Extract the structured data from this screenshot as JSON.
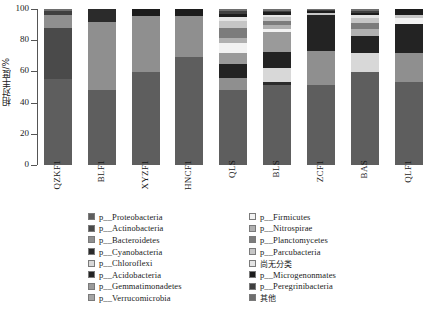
{
  "chart_data": {
    "type": "bar",
    "subtype": "stacked-percentage",
    "title": "",
    "xlabel": "",
    "ylabel": "相对丰度/%",
    "ylim": [
      0,
      100
    ],
    "yticks": [
      "0",
      "20",
      "40",
      "60",
      "80",
      "100"
    ],
    "grid": false,
    "legend_position": "bottom",
    "categories": [
      "QZKF1",
      "BLF1",
      "XYZF1",
      "HNCF1",
      "QLS",
      "BLS",
      "ZCF1",
      "BAS",
      "QLF1"
    ],
    "series": [
      {
        "name": "p__Proteobacteria",
        "color": "#5e5e5e",
        "values": [
          55.0,
          48.0,
          59.5,
          69.5,
          48.0,
          51.5,
          51.0,
          59.5,
          53.5
        ]
      },
      {
        "name": "p__Actinobacteria",
        "color": "#4a4a4a",
        "values": [
          33.0,
          0.0,
          0.0,
          0.0,
          0.0,
          0.0,
          0.0,
          0.0,
          0.0
        ]
      },
      {
        "name": "p__Bacteroidetes",
        "color": "#8f8f8f",
        "values": [
          8.0,
          44.0,
          36.0,
          26.0,
          7.5,
          0.0,
          22.0,
          0.0,
          18.0
        ]
      },
      {
        "name": "p__Cyanobacteria",
        "color": "#2b2b2b",
        "values": [
          0.0,
          8.0,
          0.0,
          0.0,
          0.0,
          1.5,
          0.0,
          0.0,
          0.0
        ]
      },
      {
        "name": "p__Chloroflexi",
        "color": "#d8d8d8",
        "values": [
          0.0,
          0.0,
          0.0,
          0.0,
          0.0,
          9.0,
          0.0,
          12.0,
          0.0
        ]
      },
      {
        "name": "p__Acidobacteria",
        "color": "#232323",
        "values": [
          0.0,
          0.0,
          0.0,
          0.0,
          9.0,
          10.5,
          23.0,
          11.0,
          19.0
        ]
      },
      {
        "name": "p__Gemmatimonadetes",
        "color": "#9a9a9a",
        "values": [
          0.0,
          0.0,
          0.0,
          0.0,
          7.5,
          13.0,
          0.0,
          0.0,
          0.0
        ]
      },
      {
        "name": "p__Verrucomicrobia",
        "color": "#a5a5a5",
        "values": [
          0.0,
          0.0,
          0.0,
          0.0,
          0.0,
          0.0,
          0.0,
          0.0,
          0.0
        ]
      },
      {
        "name": "p__Firmicutes",
        "color": "#f2f2f2",
        "values": [
          0.0,
          0.0,
          0.0,
          0.0,
          6.0,
          2.0,
          0.0,
          0.0,
          4.0
        ]
      },
      {
        "name": "p__Nitrospirae",
        "color": "#b0b0b0",
        "values": [
          0.0,
          0.0,
          0.0,
          0.0,
          3.5,
          2.0,
          0.0,
          4.5,
          0.0
        ]
      },
      {
        "name": "p__Planctomycetes",
        "color": "#7c7c7c",
        "values": [
          0.0,
          0.0,
          0.0,
          0.0,
          6.5,
          3.0,
          0.0,
          4.0,
          0.0
        ]
      },
      {
        "name": "p__Parcubacteria",
        "color": "#c6c6c6",
        "values": [
          0.0,
          0.0,
          0.0,
          0.0,
          4.5,
          2.5,
          1.5,
          3.0,
          2.0
        ]
      },
      {
        "name": "尚无分类",
        "color": "#e4e4e4",
        "values": [
          0.0,
          0.0,
          0.0,
          0.0,
          2.5,
          1.5,
          0.0,
          2.0,
          0.0
        ]
      },
      {
        "name": "p__Microgenonmates",
        "color": "#1c1c1c",
        "values": [
          0.0,
          0.0,
          4.5,
          4.5,
          2.0,
          1.5,
          1.0,
          1.5,
          3.5
        ]
      },
      {
        "name": "p__Peregrinibacteria",
        "color": "#3f3f3f",
        "values": [
          3.0,
          0.0,
          0.0,
          0.0,
          1.5,
          1.0,
          1.0,
          1.5,
          0.0
        ]
      },
      {
        "name": "其他",
        "color": "#6e6e6e",
        "values": [
          1.0,
          0.0,
          0.0,
          0.0,
          1.5,
          1.0,
          0.5,
          1.0,
          0.0
        ]
      }
    ]
  },
  "axis": {
    "y_title": "相对丰度/%",
    "y_ticks": [
      "100",
      "80",
      "60",
      "40",
      "20",
      "0"
    ]
  },
  "legend": {
    "left_column": [
      {
        "label": "p__Proteobacteria",
        "color": "#5e5e5e"
      },
      {
        "label": "p__Actinobacteria",
        "color": "#4a4a4a"
      },
      {
        "label": "p__Bacteroidetes",
        "color": "#8f8f8f"
      },
      {
        "label": "p__Cyanobacteria",
        "color": "#2b2b2b"
      },
      {
        "label": "p__Chloroflexi",
        "color": "#d8d8d8"
      },
      {
        "label": "p__Acidobacteria",
        "color": "#232323"
      },
      {
        "label": "p__Gemmatimonadetes",
        "color": "#9a9a9a"
      },
      {
        "label": "p__Verrucomicrobia",
        "color": "#a5a5a5"
      }
    ],
    "right_column": [
      {
        "label": "p__Firmicutes",
        "color": "#f2f2f2"
      },
      {
        "label": "p__Nitrospirae",
        "color": "#b0b0b0"
      },
      {
        "label": "p__Planctomycetes",
        "color": "#7c7c7c"
      },
      {
        "label": "p__Parcubacteria",
        "color": "#c6c6c6"
      },
      {
        "label": "尚无分类",
        "color": "#e4e4e4"
      },
      {
        "label": "p__Microgenonmates",
        "color": "#1c1c1c"
      },
      {
        "label": "p__Peregrinibacteria",
        "color": "#3f3f3f"
      },
      {
        "label": "其他",
        "color": "#6e6e6e"
      }
    ]
  }
}
